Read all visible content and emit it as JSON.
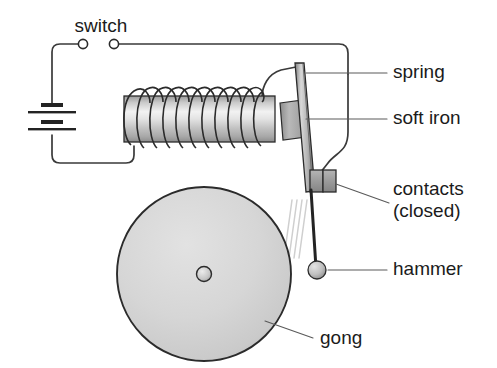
{
  "diagram": {
    "background_color": "#ffffff",
    "ink_color": "#1b1b1b",
    "wire_color": "#3a3a3a",
    "leader_color": "#5a5a5a",
    "metal_light": "#e9e9e9",
    "metal_mid": "#bdbdbd",
    "metal_dark": "#8f8f8f",
    "gong_fill": "#d6d6d6",
    "gong_stroke": "#2b2b2b",
    "motion_line_color": "#cfcfcf"
  },
  "labels": {
    "switch": "switch",
    "spring": "spring",
    "soft_iron": "soft iron",
    "contacts_line1": "contacts",
    "contacts_line2": "(closed)",
    "hammer": "hammer",
    "gong": "gong"
  },
  "parts": {
    "battery": {
      "name": "battery",
      "plate_count": 4,
      "plate_pattern": "short-long-short-long"
    },
    "switch": {
      "name": "switch",
      "state": "closed",
      "terminal_count": 2
    },
    "electromagnet": {
      "name": "electromagnet-coil",
      "turns": 11
    },
    "armature": {
      "name": "springy-armature-bar"
    },
    "soft_iron": {
      "name": "soft-iron-armature-block"
    },
    "contacts": {
      "name": "make-and-break-contacts",
      "state": "closed",
      "block_count": 2
    },
    "hammer": {
      "name": "hammer-ball"
    },
    "gong": {
      "name": "gong-disc",
      "has_center_hub": true
    },
    "motion_lines": {
      "name": "motion-lines",
      "count": 4
    }
  }
}
